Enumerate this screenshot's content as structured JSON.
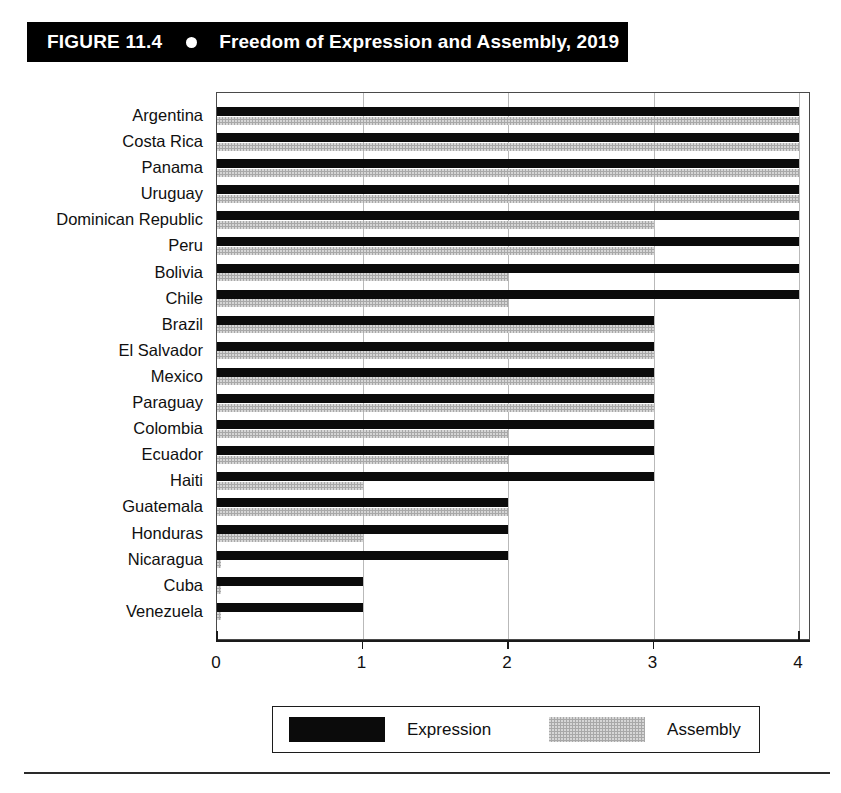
{
  "figure": {
    "number": "FIGURE 11.4",
    "bullet_icon": "filled-circle-icon",
    "title": "Freedom of Expression and Assembly, 2019"
  },
  "legend": {
    "position": "bottom",
    "items": [
      {
        "label": "Expression",
        "color": "#0b0b0b",
        "swatch": "black-swatch"
      },
      {
        "label": "Assembly",
        "color": "#a8a8a8",
        "swatch": "gray-swatch"
      }
    ]
  },
  "axis": {
    "x_ticks": [
      "0",
      "1",
      "2",
      "3",
      "4"
    ],
    "x_min": 0,
    "x_max": 4,
    "grid": true
  },
  "chart_data": {
    "type": "bar",
    "orientation": "horizontal",
    "title": "Freedom of Expression and Assembly, 2019",
    "xlabel": "",
    "ylabel": "",
    "xlim": [
      0,
      4
    ],
    "xticks": [
      0,
      1,
      2,
      3,
      4
    ],
    "grid": true,
    "legend_position": "bottom",
    "categories": [
      "Argentina",
      "Costa Rica",
      "Panama",
      "Uruguay",
      "Dominican Republic",
      "Peru",
      "Bolivia",
      "Chile",
      "Brazil",
      "El Salvador",
      "Mexico",
      "Paraguay",
      "Colombia",
      "Ecuador",
      "Haiti",
      "Guatemala",
      "Honduras",
      "Nicaragua",
      "Cuba",
      "Venezuela"
    ],
    "series": [
      {
        "name": "Expression",
        "color": "#0b0b0b",
        "values": [
          4,
          4,
          4,
          4,
          4,
          4,
          4,
          4,
          3,
          3,
          3,
          3,
          3,
          3,
          3,
          2,
          2,
          2,
          1,
          1
        ]
      },
      {
        "name": "Assembly",
        "color": "#a8a8a8",
        "values": [
          4,
          4,
          4,
          4,
          3,
          3,
          2,
          2,
          3,
          3,
          3,
          3,
          2,
          2,
          1,
          2,
          1,
          0,
          0,
          0
        ]
      }
    ]
  }
}
